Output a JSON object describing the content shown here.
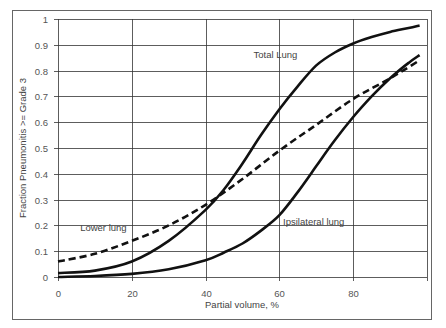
{
  "chart_data": {
    "type": "line",
    "title": "",
    "xlabel": "Partial volume, %",
    "ylabel": "Fraction Pneumonitis >= Grade 3",
    "xlim": [
      0,
      100
    ],
    "ylim": [
      0,
      1
    ],
    "x_ticks": [
      "0",
      "20",
      "40",
      "60",
      "80"
    ],
    "y_ticks": [
      "0",
      "0.1",
      "0.2",
      "0.3",
      "0.4",
      "0.5",
      "0.6",
      "0.7",
      "0.8",
      "0.9",
      "1"
    ],
    "grid": true,
    "legend": "none (inline annotations)",
    "series": [
      {
        "name": "Total Lung",
        "style": "solid",
        "x": [
          0,
          10,
          20,
          30,
          40,
          45,
          50,
          55,
          60,
          65,
          70,
          75,
          80,
          85,
          90,
          95,
          98
        ],
        "y": [
          0.015,
          0.025,
          0.06,
          0.14,
          0.26,
          0.34,
          0.44,
          0.55,
          0.65,
          0.74,
          0.82,
          0.87,
          0.905,
          0.93,
          0.95,
          0.965,
          0.975
        ]
      },
      {
        "name": "Ipsilateral lung",
        "style": "solid",
        "x": [
          0,
          10,
          20,
          30,
          40,
          45,
          50,
          55,
          60,
          65,
          70,
          75,
          80,
          85,
          90,
          95,
          98
        ],
        "y": [
          0.0,
          0.004,
          0.012,
          0.03,
          0.065,
          0.095,
          0.13,
          0.18,
          0.24,
          0.33,
          0.43,
          0.53,
          0.62,
          0.7,
          0.77,
          0.83,
          0.86
        ]
      },
      {
        "name": "Lower lung",
        "style": "dashed",
        "x": [
          0,
          10,
          20,
          30,
          40,
          50,
          60,
          70,
          80,
          90,
          98
        ],
        "y": [
          0.06,
          0.09,
          0.14,
          0.2,
          0.28,
          0.38,
          0.49,
          0.59,
          0.69,
          0.77,
          0.84
        ]
      }
    ],
    "annotations": [
      {
        "text": "Total Lung",
        "x": 53,
        "y": 0.85
      },
      {
        "text": "Lower lung",
        "x": 6,
        "y": 0.18
      },
      {
        "text": "Ipsilateral lung",
        "x": 61,
        "y": 0.2
      }
    ]
  }
}
